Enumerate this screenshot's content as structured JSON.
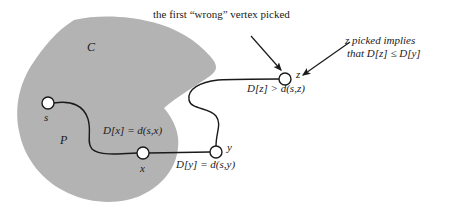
{
  "figure": {
    "type": "graph-diagram",
    "topic": "Dijkstra correctness proof illustration",
    "colors": {
      "region_fill": "#b3b3b3",
      "stroke": "#1a1a1a",
      "node_fill": "#ffffff",
      "background": "#ffffff",
      "text": "#1a1a1a"
    }
  },
  "annotations": {
    "top_caption": "the first “wrong” vertex picked",
    "right_caption_line1": "z picked implies",
    "right_caption_line2": "that  D[z] ≤  D[y]"
  },
  "regions": [
    {
      "id": "cloud",
      "label": "C",
      "x": 87,
      "y": 48
    }
  ],
  "path_label": {
    "label": "P",
    "x": 60,
    "y": 141
  },
  "nodes": [
    {
      "id": "s",
      "label": "s",
      "cx": 48,
      "cy": 103,
      "r": 6,
      "label_x": 44,
      "label_y": 119
    },
    {
      "id": "x",
      "label": "x",
      "cx": 143,
      "cy": 153,
      "r": 6,
      "label_x": 140,
      "label_y": 170
    },
    {
      "id": "y",
      "label": "y",
      "cx": 216,
      "cy": 152,
      "r": 6,
      "label_x": 227,
      "label_y": 148
    },
    {
      "id": "z",
      "label": "z",
      "cx": 285,
      "cy": 79,
      "r": 6,
      "label_x": 296,
      "label_y": 75
    }
  ],
  "edge_labels": [
    {
      "id": "dx",
      "text": "D[x] =  d(s,x)",
      "x": 103,
      "y": 131
    },
    {
      "id": "dy",
      "text": "D[y] =  d(s,y)",
      "x": 176,
      "y": 165
    },
    {
      "id": "dz",
      "text": "D[z] >  d(s,z)",
      "x": 247,
      "y": 89
    }
  ],
  "arrows": [
    {
      "id": "arrow-to-z-left",
      "from_x": 251,
      "from_y": 36,
      "to_x": 281,
      "to_y": 70
    },
    {
      "id": "arrow-to-z-right",
      "from_x": 350,
      "from_y": 42,
      "to_x": 303,
      "to_y": 75
    }
  ]
}
